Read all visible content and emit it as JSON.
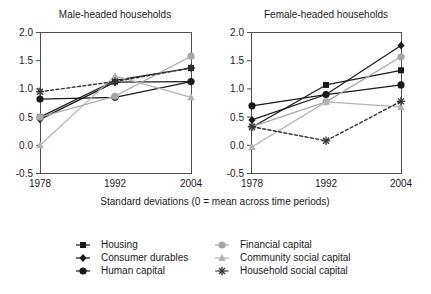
{
  "chart_data": {
    "type": "line",
    "title": "",
    "xlabel": "Standard deviations (0 = mean across time periods)",
    "ylabel": "",
    "x": [
      1978,
      1992,
      2004
    ],
    "xtick_labels": [
      "1978",
      "1992",
      "2004"
    ],
    "ytick_labels": [
      "-0.5",
      "0.0",
      "0.5",
      "1.0",
      "1.5",
      "2.0"
    ],
    "ytick_values": [
      -0.5,
      0.0,
      0.5,
      1.0,
      1.5,
      2.0
    ],
    "ylim": [
      -0.5,
      2.0
    ],
    "grid": false,
    "legend_position": "bottom",
    "panels": [
      {
        "name": "male-headed-households",
        "title": "Male-headed households",
        "series": [
          {
            "name": "Housing",
            "values": [
              0.5,
              1.15,
              1.37
            ]
          },
          {
            "name": "Consumer durables",
            "values": [
              0.46,
              1.12,
              1.13
            ]
          },
          {
            "name": "Human capital",
            "values": [
              0.82,
              0.85,
              1.13
            ]
          },
          {
            "name": "Financial capital",
            "values": [
              0.5,
              0.87,
              1.58
            ]
          },
          {
            "name": "Community social capital",
            "values": [
              0.0,
              1.23,
              0.85
            ]
          },
          {
            "name": "Household social capital",
            "values": [
              0.95,
              1.13,
              1.37
            ]
          }
        ]
      },
      {
        "name": "female-headed-households",
        "title": "Female-headed households",
        "series": [
          {
            "name": "Housing",
            "values": [
              0.32,
              1.07,
              1.33
            ]
          },
          {
            "name": "Consumer durables",
            "values": [
              0.45,
              0.9,
              1.77
            ]
          },
          {
            "name": "Human capital",
            "values": [
              0.7,
              0.9,
              1.07
            ]
          },
          {
            "name": "Financial capital",
            "values": [
              0.33,
              0.77,
              1.57
            ]
          },
          {
            "name": "Community social capital",
            "values": [
              -0.03,
              0.77,
              0.68
            ]
          },
          {
            "name": "Household social capital",
            "values": [
              0.33,
              0.08,
              0.78
            ]
          }
        ]
      }
    ],
    "legend": [
      {
        "label": "Housing",
        "marker": "square-icon",
        "color": "#1a1a1a",
        "dash": "none"
      },
      {
        "label": "Consumer durables",
        "marker": "diamond-icon",
        "color": "#1a1a1a",
        "dash": "none"
      },
      {
        "label": "Human capital",
        "marker": "circle-icon",
        "color": "#1a1a1a",
        "dash": "none"
      },
      {
        "label": "Financial capital",
        "marker": "circle-icon",
        "color": "#a6a6a6",
        "dash": "none"
      },
      {
        "label": "Community social capital",
        "marker": "triangle-icon",
        "color": "#b3b3b3",
        "dash": "none"
      },
      {
        "label": "Household social capital",
        "marker": "asterisk-icon",
        "color": "#333333",
        "dash": "dashed"
      }
    ]
  }
}
